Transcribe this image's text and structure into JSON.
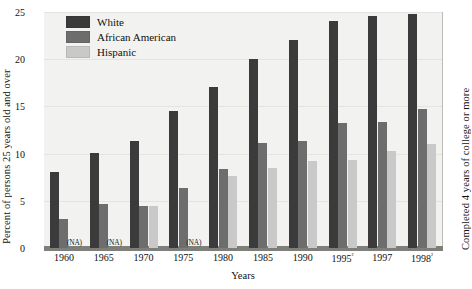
{
  "chart_data": {
    "type": "bar",
    "title": "",
    "xlabel": "Years",
    "ylabel": "Percent of persons 25 years old and over",
    "ylabel_right": "Completed 4 years of college or more",
    "ylim": [
      0,
      25
    ],
    "yticks": [
      0,
      5,
      10,
      15,
      20,
      25
    ],
    "grid": true,
    "legend_position": "top-left",
    "categories": [
      "1960",
      "1965",
      "1970",
      "1975",
      "1980",
      "1985",
      "1990",
      "1995²",
      "1997",
      "1998²"
    ],
    "series": [
      {
        "name": "White",
        "color": "#3b3b3b",
        "values": [
          8.1,
          10.1,
          11.3,
          14.5,
          17.1,
          20.0,
          22.0,
          24.0,
          24.6,
          24.8
        ]
      },
      {
        "name": "African American",
        "color": "#6d6d6d",
        "values": [
          3.1,
          4.7,
          4.4,
          6.4,
          8.4,
          11.1,
          11.3,
          13.2,
          13.3,
          14.7
        ]
      },
      {
        "name": "Hispanic",
        "color": "#c9c9c9",
        "values": [
          null,
          null,
          4.5,
          null,
          7.6,
          8.5,
          9.2,
          9.3,
          10.3,
          11.0
        ]
      }
    ],
    "missing_label": "(NA)",
    "missing_cells": [
      {
        "category": "1960",
        "series": "Hispanic"
      },
      {
        "category": "1965",
        "series": "Hispanic"
      },
      {
        "category": "1975",
        "series": "Hispanic"
      }
    ]
  },
  "legend": {
    "items": [
      {
        "label": "White",
        "color": "#3b3b3b"
      },
      {
        "label": "African American",
        "color": "#6d6d6d"
      },
      {
        "label": "Hispanic",
        "color": "#c9c9c9"
      }
    ]
  },
  "colors": {
    "plot_background": "#f2f2f0",
    "gridline": "#e3e3df",
    "baseline": "#7e7e7a",
    "text": "#111111"
  }
}
